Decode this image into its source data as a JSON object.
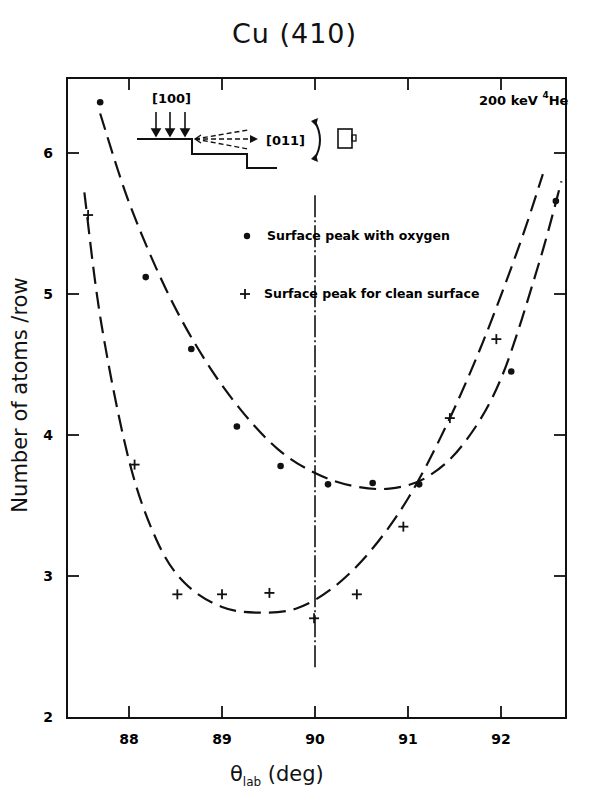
{
  "chart_data": {
    "type": "scatter",
    "title": "Cu (410)",
    "annotation": "200 keV 4He",
    "annotation_parts": {
      "energy": "200 keV",
      "isotope_mass": "4",
      "element": "He"
    },
    "xlabel": "θlab (deg)",
    "xlabel_parts": {
      "symbol": "θ",
      "subscript": "lab",
      "unit": "(deg)"
    },
    "ylabel": "Number of atoms /row",
    "xlim": [
      87.33,
      92.69
    ],
    "ylim": [
      2,
      6.6
    ],
    "xticks": [
      88,
      89,
      90,
      91,
      92
    ],
    "yticks": [
      2,
      3,
      4,
      5,
      6
    ],
    "grid": false,
    "legend_position": "upper right (inside)",
    "series": [
      {
        "name": "Surface peak with oxygen",
        "marker": "dot",
        "fit_line": "long-dashed",
        "x": [
          87.69,
          88.18,
          88.67,
          89.16,
          89.63,
          90.14,
          90.62,
          91.12,
          92.11,
          92.59
        ],
        "y": [
          6.36,
          5.12,
          4.61,
          4.06,
          3.78,
          3.65,
          3.66,
          3.65,
          4.45,
          5.66
        ],
        "fit_curve": {
          "x": [
            87.69,
            88.0,
            88.4,
            88.8,
            89.2,
            89.6,
            90.0,
            90.4,
            90.8,
            91.2,
            91.6,
            92.0,
            92.4,
            92.65
          ],
          "y": [
            6.28,
            5.65,
            5.03,
            4.55,
            4.18,
            3.9,
            3.73,
            3.64,
            3.62,
            3.7,
            3.94,
            4.4,
            5.2,
            5.8
          ]
        }
      },
      {
        "name": "Surface peak for clean surface",
        "marker": "plus",
        "fit_line": "long-dashed",
        "x": [
          87.56,
          88.06,
          88.52,
          89.0,
          89.51,
          89.99,
          90.45,
          90.95,
          91.45,
          91.95
        ],
        "y": [
          5.56,
          3.79,
          2.87,
          2.87,
          2.88,
          2.7,
          2.87,
          3.35,
          4.12,
          4.68
        ],
        "fit_curve": {
          "x": [
            87.52,
            87.7,
            88.0,
            88.3,
            88.6,
            89.0,
            89.4,
            89.8,
            90.2,
            90.6,
            91.0,
            91.4,
            91.8,
            92.2,
            92.45
          ],
          "y": [
            5.72,
            4.8,
            3.82,
            3.25,
            2.95,
            2.78,
            2.74,
            2.77,
            2.92,
            3.18,
            3.55,
            4.05,
            4.65,
            5.35,
            5.85
          ]
        }
      }
    ],
    "vertical_reference_line": {
      "x": 90.0,
      "y_range": [
        2.35,
        5.7
      ],
      "style": "dash-dot"
    },
    "inset_diagram": {
      "incident_direction_label": "[100]",
      "exit_direction_label": "[011]",
      "description": "Stepped surface with three incident beam arrows, dashed scattered beams toward detector, rotation arrow and detector box"
    }
  },
  "title": "Cu (410)",
  "labels": {
    "y_axis": "Number of atoms /row",
    "x_axis_symbol": "θ",
    "x_axis_sub": "lab",
    "x_axis_unit": " (deg)",
    "beam": "200 keV ",
    "beam_mass": "4",
    "beam_element": "He",
    "inset_in": "[100]",
    "inset_out": "[011]"
  },
  "legend": [
    {
      "marker": "dot",
      "label": "Surface peak  with oxygen"
    },
    {
      "marker": "plus",
      "label": "Surface peak  for clean surface"
    }
  ],
  "ticks": {
    "x": [
      "88",
      "89",
      "90",
      "91",
      "92"
    ],
    "y": [
      "2",
      "3",
      "4",
      "5",
      "6"
    ]
  }
}
